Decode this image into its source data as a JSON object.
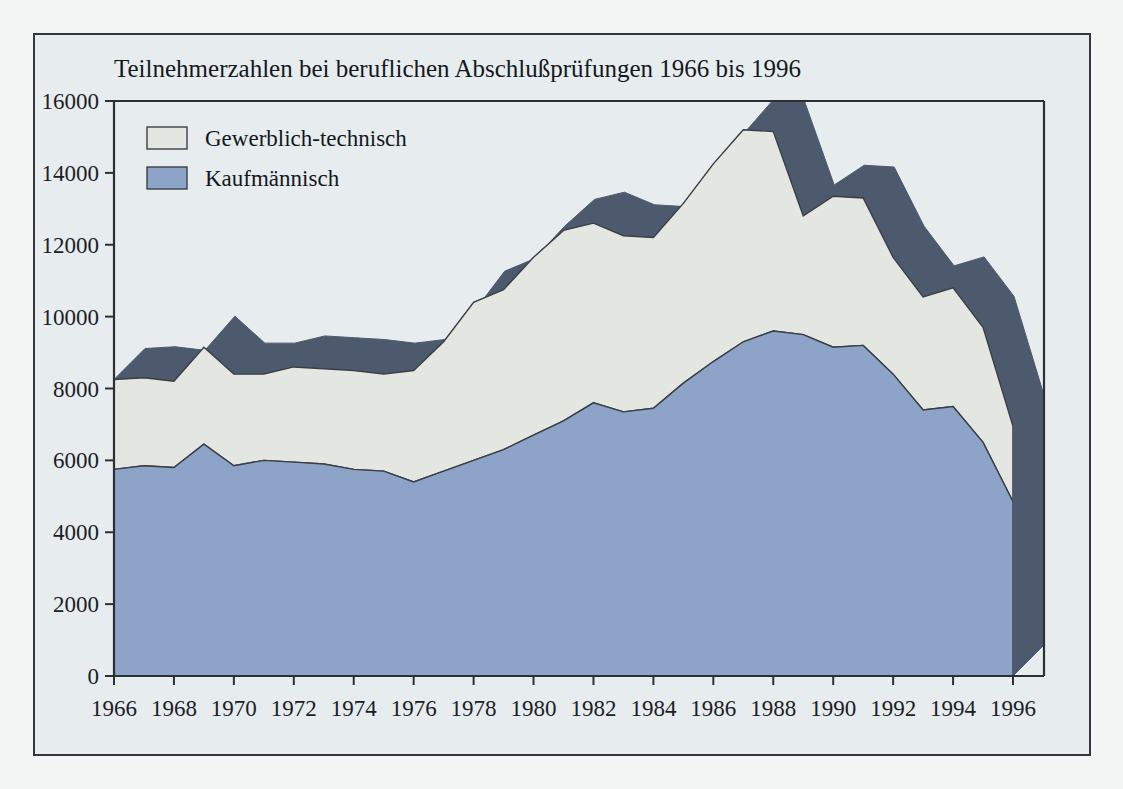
{
  "figure": {
    "title": "Teilnehmerzahlen bei beruflichen Abschlußprüfungen 1966 bis 1996",
    "background_color": "#e7edee",
    "frame_color": "#34383c"
  },
  "legend": {
    "position": "top-left-inside",
    "items": [
      {
        "label": "Gewerblich-technisch",
        "color": "#e4e6e2",
        "border": "#3a3f46"
      },
      {
        "label": "Kaufmännisch",
        "color": "#8da4c8",
        "border": "#3a3f46"
      }
    ]
  },
  "axes": {
    "y": {
      "ticks": [
        "0",
        "2000",
        "4000",
        "6000",
        "8000",
        "10000",
        "12000",
        "14000",
        "16000"
      ],
      "min": 0,
      "max": 16000,
      "step": 2000
    },
    "x": {
      "ticks": [
        "1966",
        "1968",
        "1970",
        "1972",
        "1974",
        "1976",
        "1978",
        "1980",
        "1982",
        "1984",
        "1986",
        "1988",
        "1990",
        "1992",
        "1994",
        "1996"
      ],
      "min": 1966,
      "max": 1996
    }
  },
  "chart_data": {
    "type": "area",
    "title": "Teilnehmerzahlen bei beruflichen Abschlußprüfungen 1966 bis 1996",
    "xlabel": "",
    "ylabel": "",
    "stacked": true,
    "three_d": true,
    "depth_band_color": "#4d5a6e",
    "grid": false,
    "legend_position": "top-left",
    "xlim": [
      1966,
      1996
    ],
    "ylim": [
      0,
      16000
    ],
    "x": [
      1966,
      1967,
      1968,
      1969,
      1970,
      1971,
      1972,
      1973,
      1974,
      1975,
      1976,
      1977,
      1978,
      1979,
      1980,
      1981,
      1982,
      1983,
      1984,
      1985,
      1986,
      1987,
      1988,
      1989,
      1990,
      1991,
      1992,
      1993,
      1994,
      1995,
      1996
    ],
    "categories": [
      "1966",
      "1967",
      "1968",
      "1969",
      "1970",
      "1971",
      "1972",
      "1973",
      "1974",
      "1975",
      "1976",
      "1977",
      "1978",
      "1979",
      "1980",
      "1981",
      "1982",
      "1983",
      "1984",
      "1985",
      "1986",
      "1987",
      "1988",
      "1989",
      "1990",
      "1991",
      "1992",
      "1993",
      "1994",
      "1995",
      "1996"
    ],
    "series": [
      {
        "name": "Kaufmännisch",
        "color": "#8da4c8",
        "values": [
          5750,
          5850,
          5800,
          6450,
          5850,
          6000,
          5950,
          5900,
          5750,
          5700,
          5400,
          5700,
          6000,
          6300,
          6700,
          7100,
          7600,
          7350,
          7450,
          8150,
          8750,
          9300,
          9600,
          9500,
          9150,
          9200,
          8400,
          7400,
          7500,
          6500,
          4850
        ]
      },
      {
        "name": "Gewerblich-technisch",
        "color": "#e4e6e2",
        "values": [
          2500,
          2450,
          2400,
          2700,
          2550,
          2400,
          2650,
          2650,
          2750,
          2700,
          3100,
          3600,
          4400,
          4450,
          4950,
          5300,
          5000,
          4900,
          4750,
          5000,
          5500,
          5900,
          5550,
          3300,
          4200,
          4100,
          3250,
          3150,
          3300,
          3200,
          2100
        ]
      }
    ],
    "totals": [
      8250,
      8300,
      8200,
      9150,
      8400,
      8400,
      8600,
      8550,
      8500,
      8400,
      8500,
      9300,
      10400,
      10750,
      11650,
      12400,
      12600,
      12250,
      12200,
      13150,
      14250,
      15200,
      15150,
      12800,
      13350,
      13300,
      11650,
      10550,
      10800,
      9700,
      6950
    ]
  }
}
